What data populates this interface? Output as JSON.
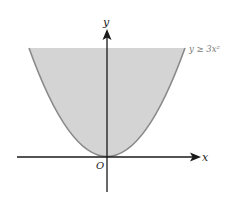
{
  "figure": {
    "type": "inequality-region",
    "inequality_label": "y ≥ 3x²",
    "axes": {
      "x_label": "x",
      "y_label": "y",
      "origin_label": "O"
    },
    "colors": {
      "shading": "#d4d4d4",
      "curve": "#8a8a8a",
      "axes": "#1a1a1a",
      "label_text": "#222222",
      "inequality_text": "#777777"
    }
  }
}
